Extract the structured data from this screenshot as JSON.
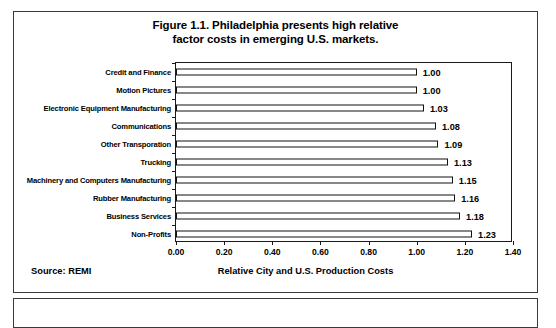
{
  "figure": {
    "title_line1": "Figure 1.1. Philadelphia presents high relative",
    "title_line2": "factor costs in emerging U.S. markets.",
    "source_note": "Source: REMI"
  },
  "chart_data": {
    "type": "bar",
    "orientation": "horizontal",
    "title": "Figure 1.1. Philadelphia presents high relative factor costs in emerging U.S. markets.",
    "xlabel": "Relative City and U.S. Production Costs",
    "ylabel": "",
    "xlim": [
      0.0,
      1.4
    ],
    "xticks": [
      "0.00",
      "0.20",
      "0.40",
      "0.60",
      "0.80",
      "1.00",
      "1.20",
      "1.40"
    ],
    "xtick_values": [
      0.0,
      0.2,
      0.4,
      0.6,
      0.8,
      1.0,
      1.2,
      1.4
    ],
    "grid": false,
    "legend": false,
    "bar_fill": "#ffffff",
    "bar_edge": "#111111",
    "categories": [
      "Credit and Finance",
      "Motion Pictures",
      "Electronic Equipment Manufacturing",
      "Communications",
      "Other Transporation",
      "Trucking",
      "Machinery and Computers Manufacturing",
      "Rubber Manufacturing",
      "Business Services",
      "Non-Profits"
    ],
    "values": [
      1.0,
      1.0,
      1.03,
      1.08,
      1.09,
      1.13,
      1.15,
      1.16,
      1.18,
      1.23
    ],
    "value_labels": [
      "1.00",
      "1.00",
      "1.03",
      "1.08",
      "1.09",
      "1.13",
      "1.15",
      "1.16",
      "1.18",
      "1.23"
    ]
  }
}
